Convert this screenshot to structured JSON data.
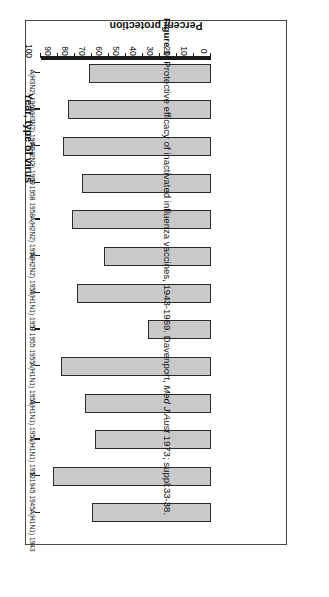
{
  "figure": {
    "caption_label": "Figure 1:",
    "caption_text": " Protective efficacy of inactivated influenza vaccines, 1943-1969. Davenport, ",
    "caption_italic": "Med J Aust",
    "caption_tail": " 1973; suppl:33-38."
  },
  "chart_data": {
    "type": "bar",
    "orientation": "vertical-rendered-rotated-180",
    "title": "",
    "xlabel": "Year, type of virus",
    "ylabel": "Percent protection",
    "ylim": [
      0,
      100
    ],
    "ytick_labels": [
      "100",
      "90",
      "80",
      "70",
      "60",
      "50",
      "40",
      "30",
      "20",
      "10",
      "0"
    ],
    "ytick_values": [
      100,
      90,
      80,
      70,
      60,
      50,
      40,
      30,
      20,
      10,
      0
    ],
    "grid": false,
    "legend": "none",
    "bar_fill": "#c9c9c9",
    "bar_stroke": "#2b2b2b",
    "categories": [
      "1943 A(H1N1)",
      "1945 B 1945",
      "1950 A(H1N1)",
      "1951 A(H1N1)",
      "1953 A(H1N1)",
      "1955 B 1955",
      "1957 A(H1N1)",
      "1957 A(H2N2)",
      "1958 A(H2N2)",
      "1958 B 1958",
      "1960 A(H2N2)",
      "1968 A(H3N2)",
      "1969 A(H3N2)"
    ],
    "category_years": [
      "1943",
      "1945",
      "1950",
      "1951",
      "1953",
      "1955",
      "1957",
      "1957",
      "1958",
      "1958",
      "1960",
      "1968",
      "1969"
    ],
    "category_virus": [
      "A(H1N1)",
      "B 1945",
      "A(H1N1)",
      "A(H1N1)",
      "A(H1N1)",
      "B 1955",
      "A(H1N1)",
      "A(H2N2)",
      "A(H2N2)",
      "B 1958",
      "A(H2N2)",
      "A(H3N2)",
      "A(H3N2)"
    ],
    "category_tick_labels": [
      "A(H1N1)   1943",
      "B 1945   1945",
      "A(H1N1)   1950",
      "A(H1N1)   1951",
      "A(H1N1)   1953",
      "B 1955   1955",
      "A(H1N1)   1957",
      "A(H2N2)   1957",
      "A(H2N2)   1958",
      "B 1958   1958",
      "A(H2N2)   1960",
      "A(H3N2)   1968",
      "A(H3N2)   1969"
    ],
    "values": [
      70,
      93,
      68,
      74,
      88,
      37,
      79,
      63,
      82,
      76,
      87,
      84,
      72
    ]
  }
}
